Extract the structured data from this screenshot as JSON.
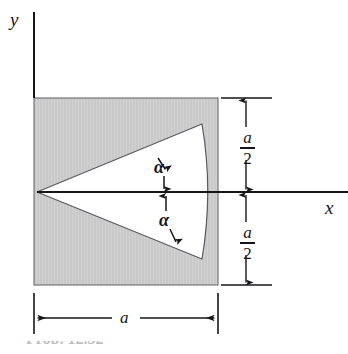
{
  "figure": {
    "type": "engineering-cross-section-diagram",
    "caption_fragment": "Prob. 12.32"
  },
  "colors": {
    "shaded_fill": "#c9c9c9",
    "shaded_fill_light": "#d6d6d6",
    "outline": "#55555a",
    "line": "#16161a",
    "background": "#ffffff"
  },
  "axes": {
    "y_label": "y",
    "x_label": "x"
  },
  "angles": {
    "upper_label": "α",
    "lower_label": "α"
  },
  "dimensions": {
    "width_label": "a",
    "half_upper": {
      "numerator": "a",
      "denominator": "2"
    },
    "half_lower": {
      "numerator": "a",
      "denominator": "2"
    }
  },
  "geometry": {
    "square": {
      "left": 34,
      "top": 98,
      "right": 218,
      "bottom": 285
    },
    "wedge_apex": {
      "x": 37,
      "y": 192
    },
    "wedge_top_vertex": {
      "x": 202,
      "y": 124
    },
    "wedge_bottom_vertex": {
      "x": 202,
      "y": 259
    },
    "arc_bulge_x": 212,
    "x_axis_y": 192,
    "y_axis_x": 34,
    "dim_line_x": 246,
    "bottom_dim_y": 318
  }
}
